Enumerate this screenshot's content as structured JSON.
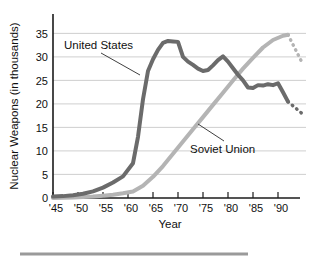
{
  "chart_data": {
    "type": "line",
    "title": "",
    "xlabel": "Year",
    "ylabel": "Nuclear Weapons (in thousands)",
    "xlim": [
      1945,
      1995
    ],
    "ylim": [
      0,
      37
    ],
    "grid": true,
    "legend_position": "inline-annotations",
    "x_tick_labels": [
      "'45",
      "'50",
      "'55",
      "'60",
      "'65",
      "'70",
      "'75",
      "'80",
      "'85",
      "'90"
    ],
    "x_tick_values": [
      1945,
      1950,
      1955,
      1960,
      1965,
      1970,
      1975,
      1980,
      1985,
      1990
    ],
    "y_tick_labels": [
      "0",
      "5",
      "10",
      "15",
      "20",
      "25",
      "30",
      "35"
    ],
    "y_tick_values": [
      0,
      5,
      10,
      15,
      20,
      25,
      30,
      35
    ],
    "series": [
      {
        "name": "United States",
        "color": "#6b6b6b",
        "x": [
          1945,
          1947,
          1949,
          1951,
          1953,
          1955,
          1957,
          1959,
          1961,
          1962,
          1963,
          1964,
          1965,
          1966,
          1967,
          1968,
          1969,
          1970,
          1971,
          1972,
          1973,
          1974,
          1975,
          1976,
          1977,
          1978,
          1979,
          1980,
          1981,
          1982,
          1983,
          1984,
          1985,
          1986,
          1987,
          1988,
          1989,
          1990,
          1991,
          1992
        ],
        "values": [
          0.3,
          0.4,
          0.6,
          0.9,
          1.4,
          2.2,
          3.3,
          4.6,
          7.4,
          13.0,
          21.0,
          27.0,
          29.5,
          31.5,
          33.0,
          33.4,
          33.3,
          33.2,
          30.0,
          29.0,
          28.3,
          27.5,
          27.0,
          27.2,
          28.2,
          29.3,
          30.1,
          29.0,
          27.6,
          26.2,
          25.0,
          23.5,
          23.4,
          24.0,
          23.9,
          24.2,
          24.0,
          24.4,
          22.5,
          20.5
        ],
        "dotted_extension": {
          "x": [
            1992,
            1995
          ],
          "values": [
            20.5,
            17.8
          ]
        }
      },
      {
        "name": "Soviet Union",
        "color": "#b4b4b4",
        "x": [
          1945,
          1949,
          1951,
          1953,
          1955,
          1957,
          1959,
          1961,
          1963,
          1965,
          1967,
          1969,
          1971,
          1973,
          1975,
          1977,
          1979,
          1981,
          1983,
          1985,
          1987,
          1989,
          1991,
          1992
        ],
        "values": [
          0.0,
          0.1,
          0.2,
          0.3,
          0.5,
          0.7,
          1.0,
          1.4,
          2.6,
          4.5,
          6.8,
          9.4,
          12.0,
          14.6,
          17.2,
          19.8,
          22.4,
          25.0,
          27.5,
          29.8,
          32.0,
          33.6,
          34.5,
          34.7
        ],
        "dotted_extension": {
          "x": [
            1992,
            1995
          ],
          "values": [
            34.7,
            28.4
          ]
        }
      }
    ],
    "annotations": [
      {
        "text": "United States",
        "series": "United States"
      },
      {
        "text": "Soviet Union",
        "series": "Soviet Union"
      }
    ]
  },
  "footer": {
    "rule_color": "#9a9a9a"
  }
}
